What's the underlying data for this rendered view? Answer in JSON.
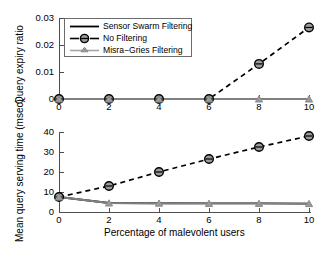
{
  "figure": {
    "width": 327,
    "height": 253,
    "background": "#ffffff",
    "axis_color": "#4d4d4d"
  },
  "legend": {
    "position": "top-left-inside-upper-panel",
    "border_color": "#6b6b6b",
    "entries": [
      {
        "label": "Sensor Swarm Filtering",
        "style": "solid",
        "marker": "none",
        "color": "#000000"
      },
      {
        "label": "No Filtering",
        "style": "dashed",
        "marker": "circle",
        "color": "#000000"
      },
      {
        "label": "Misra−Gries Filtering",
        "style": "solid",
        "marker": "triangle",
        "color": "#808080"
      }
    ]
  },
  "chart_data": [
    {
      "type": "line",
      "id": "upper-panel",
      "title": "",
      "xlabel": "",
      "ylabel": "Query expiry ratio",
      "x": [
        0,
        2,
        4,
        6,
        8,
        10
      ],
      "xticklabels": [
        "0",
        "2",
        "4",
        "6",
        "8",
        "10"
      ],
      "yticks": [
        0,
        0.01,
        0.02,
        0.03
      ],
      "yticklabels": [
        "0",
        "0.01",
        "0.02",
        "0.03"
      ],
      "xlim": [
        0,
        10
      ],
      "ylim": [
        0,
        0.03
      ],
      "grid": false,
      "series": [
        {
          "name": "Sensor Swarm Filtering",
          "values": [
            0,
            0,
            0,
            0,
            0,
            0
          ],
          "style": "solid",
          "marker": "none",
          "color": "#000000"
        },
        {
          "name": "No Filtering",
          "values": [
            0,
            0,
            0,
            0,
            0.013,
            0.0265
          ],
          "style": "dashed",
          "marker": "circle",
          "color": "#000000"
        },
        {
          "name": "Misra−Gries Filtering",
          "values": [
            0,
            0,
            0,
            0,
            0,
            0
          ],
          "style": "solid",
          "marker": "triangle",
          "color": "#808080"
        }
      ]
    },
    {
      "type": "line",
      "id": "lower-panel",
      "title": "",
      "xlabel": "Percentage of malevolent users",
      "ylabel": "Mean query serving time (msec)",
      "x": [
        0,
        2,
        4,
        6,
        8,
        10
      ],
      "xticklabels": [
        "0",
        "2",
        "4",
        "6",
        "8",
        "10"
      ],
      "yticks": [
        0,
        10,
        20,
        30,
        40
      ],
      "yticklabels": [
        "0",
        "10",
        "20",
        "30",
        "40"
      ],
      "xlim": [
        0,
        10
      ],
      "ylim": [
        0,
        40
      ],
      "grid": false,
      "series": [
        {
          "name": "Sensor Swarm Filtering",
          "values": [
            7.5,
            4.5,
            4.4,
            4.3,
            4.3,
            4.2
          ],
          "style": "solid",
          "marker": "none",
          "color": "#000000"
        },
        {
          "name": "No Filtering",
          "values": [
            7.5,
            13,
            20,
            26.5,
            32.5,
            38
          ],
          "style": "dashed",
          "marker": "circle",
          "color": "#000000"
        },
        {
          "name": "Misra−Gries Filtering",
          "values": [
            7.5,
            4.5,
            4.4,
            4.3,
            4.3,
            4.2
          ],
          "style": "solid",
          "marker": "triangle",
          "color": "#808080"
        }
      ]
    }
  ]
}
